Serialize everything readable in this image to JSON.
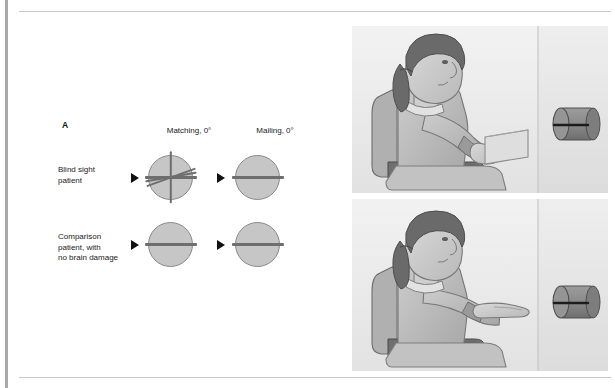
{
  "figure": {
    "clipped_header_text": "",
    "panels": [
      {
        "letter": "A"
      },
      {
        "letter": "B"
      },
      {
        "letter": "C"
      }
    ]
  },
  "panel_a": {
    "column_headers": [
      "Matching, 0°",
      "Mailing, 0°"
    ],
    "row_labels": [
      "Blind sight\npatient",
      "Comparison\npatient, with\nno brain damage"
    ],
    "colors": {
      "disc_fill": "#c6c6c6",
      "disc_stroke": "#8a8a8a",
      "line_stroke": "#6e6e6e",
      "arrow": "#111111"
    },
    "cells": [
      {
        "row": "Blind sight patient",
        "column": "Matching, 0°",
        "target_orientation_deg": 0,
        "response_orientation_deg": [
          0,
          90,
          10,
          200
        ]
      },
      {
        "row": "Blind sight patient",
        "column": "Mailing, 0°",
        "target_orientation_deg": 0,
        "response_orientation_deg": [
          0
        ]
      },
      {
        "row": "Comparison patient, with no brain damage",
        "column": "Matching, 0°",
        "target_orientation_deg": 0,
        "response_orientation_deg": [
          0
        ]
      },
      {
        "row": "Comparison patient, with no brain damage",
        "column": "Mailing, 0°",
        "target_orientation_deg": 0,
        "response_orientation_deg": [
          0
        ]
      }
    ]
  },
  "panel_b": {
    "letter": "B",
    "scene_description": "seated-woman-mailing-card-into-slot",
    "elements": [
      "woman-seated-in-chair",
      "office-chair",
      "card-held-in-hand",
      "wall-panel",
      "cylinder-with-slot"
    ]
  },
  "panel_c": {
    "letter": "C",
    "scene_description": "seated-woman-matching-hand-orientation-to-slot",
    "elements": [
      "woman-seated-in-chair",
      "office-chair",
      "flat-open-hand",
      "wall-panel",
      "cylinder-with-slot"
    ]
  }
}
